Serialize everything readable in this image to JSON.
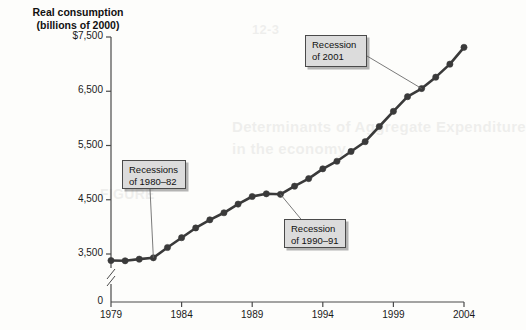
{
  "chart_data": {
    "type": "line",
    "title": "Real consumption\n(billions of 2000)",
    "title_line1": "Real consumption",
    "title_line2": "(billions of 2000)",
    "xlabel": "",
    "ylabel": "Real consumption (billions of 2000)",
    "x": [
      1979,
      1980,
      1981,
      1982,
      1983,
      1984,
      1985,
      1986,
      1987,
      1988,
      1989,
      1990,
      1991,
      1992,
      1993,
      1994,
      1995,
      1996,
      1997,
      1998,
      1999,
      2000,
      2001,
      2002,
      2003,
      2004
    ],
    "values": [
      3380,
      3375,
      3405,
      3430,
      3620,
      3800,
      3980,
      4130,
      4260,
      4420,
      4560,
      4610,
      4600,
      4750,
      4890,
      5070,
      5210,
      5390,
      5570,
      5850,
      6130,
      6400,
      6550,
      6760,
      7000,
      7310
    ],
    "series": [
      {
        "name": "Real consumption",
        "values": [
          3380,
          3375,
          3405,
          3430,
          3620,
          3800,
          3980,
          4130,
          4260,
          4420,
          4560,
          4610,
          4600,
          4750,
          4890,
          5070,
          5210,
          5390,
          5570,
          5850,
          6130,
          6400,
          6550,
          6760,
          7000,
          7310
        ]
      }
    ],
    "xticks": [
      "1979",
      "1984",
      "1989",
      "1994",
      "1999",
      "2004"
    ],
    "xtick_values": [
      1979,
      1984,
      1989,
      1994,
      1999,
      2004
    ],
    "yticks": [
      "0",
      "3,500",
      "4,500",
      "5,500",
      "6,500",
      "$7,500"
    ],
    "ytick_values": [
      0,
      3500,
      4500,
      5500,
      6500,
      7500
    ],
    "ylim": [
      3150,
      7600
    ],
    "xlim": [
      1979,
      2004
    ],
    "y_axis_break": true,
    "grid": false,
    "legend": false,
    "line_color": "#3a3a3a",
    "marker_color": "#3a3a3a",
    "marker": "circle",
    "axis_color": "#4a4a4a",
    "annotations": [
      {
        "id": "recessions-1980-82",
        "line1": "Recessions",
        "line2": "of 1980–82",
        "text": "Recessions\nof 1980–82",
        "points_to_year": 1982,
        "points_to_value": 3430
      },
      {
        "id": "recession-2001",
        "line1": "Recession",
        "line2": "of 2001",
        "text": "Recession\nof 2001",
        "points_to_year": 2001,
        "points_to_value": 6550
      },
      {
        "id": "recession-1990-91",
        "line1": "Recession",
        "line2": "of 1990–91",
        "text": "Recession\nof 1990–91",
        "points_to_year": 1991,
        "points_to_value": 4600
      }
    ]
  },
  "background_text": {
    "ghost1": "Determinants of Aggregate Expenditure",
    "ghost2": "in the economy",
    "ghost3": "FIGURE",
    "ghost4": "12-3"
  }
}
